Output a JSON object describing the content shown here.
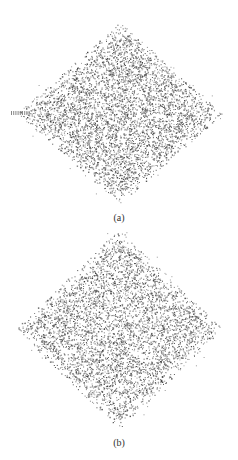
{
  "header": {
    "running_text": ""
  },
  "figures": [
    {
      "id": "a",
      "caption": "(a)",
      "shape": "diamond-scatter",
      "center": [
        120,
        113
      ],
      "half_width": 103,
      "half_height": 91,
      "left_stub": true,
      "dot_color": "#555555",
      "density": 1.0
    },
    {
      "id": "b",
      "caption": "(b)",
      "shape": "diamond-scatter",
      "center": [
        119,
        329
      ],
      "half_width": 104,
      "half_height": 100,
      "left_stub": false,
      "dot_color": "#555555",
      "density": 1.0
    }
  ]
}
